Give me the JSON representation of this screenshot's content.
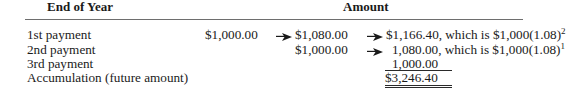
{
  "table": {
    "headers": {
      "end_of_year": "End of Year",
      "amount": "Amount"
    },
    "rows": [
      {
        "label": "1st payment",
        "values": [
          "$1,000.00",
          "$1,080.00",
          "$1,166.40"
        ],
        "note_prefix": ", which is $1,000(1.08)",
        "note_exponent": "2"
      },
      {
        "label": "2nd payment",
        "values": [
          "$1,000.00",
          "1,080.00"
        ],
        "note_prefix": ", which is $1,000(1.08)",
        "note_exponent": "1"
      },
      {
        "label": "3rd payment",
        "values": [
          "1,000.00"
        ]
      },
      {
        "label": "Accumulation (future amount)",
        "values": [
          "$3,246.40"
        ]
      }
    ],
    "icons": {
      "arrow": "right-arrow-icon"
    }
  }
}
